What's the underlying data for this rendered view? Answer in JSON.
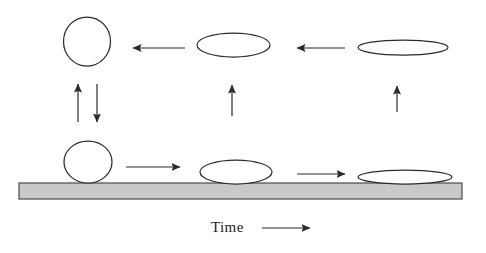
{
  "figure": {
    "axis_label": "Time",
    "axis_arrow_direction": "right",
    "background_color": "#ffffff",
    "outline_color": "#2b2b2b",
    "surface_fill_color": "#c9c9c9",
    "surface_stroke_color": "#4a4a4a"
  },
  "surface": {
    "name": "solid surface bar",
    "x": 19,
    "y": 183,
    "width": 443,
    "height": 16
  },
  "shapes": {
    "top_row": [
      {
        "name": "airborne-sphere",
        "type": "circle",
        "cx": 87,
        "cy": 41.5,
        "rx": 23.5,
        "ry": 24.5,
        "stage": "spherical"
      },
      {
        "name": "airborne-ellipse-mid",
        "type": "ellipse",
        "cx": 233.5,
        "cy": 45,
        "rx": 36.5,
        "ry": 12,
        "stage": "flattened"
      },
      {
        "name": "airborne-ellipse-flat",
        "type": "ellipse",
        "cx": 403,
        "cy": 47.5,
        "rx": 45,
        "ry": 7.5,
        "stage": "very flattened"
      }
    ],
    "bottom_row": [
      {
        "name": "resting-sphere",
        "type": "circle",
        "cx": 88,
        "cy": 162,
        "rx": 24,
        "ry": 21,
        "stage": "spherical"
      },
      {
        "name": "spreading-ellipse-mid",
        "type": "ellipse",
        "cx": 236,
        "cy": 172,
        "rx": 36,
        "ry": 12,
        "stage": "spreading"
      },
      {
        "name": "spreading-ellipse-flat",
        "type": "ellipse",
        "cx": 405,
        "cy": 177,
        "rx": 47,
        "ry": 7,
        "stage": "fully spread"
      }
    ]
  },
  "arrows": {
    "top_row": [
      {
        "name": "top-arrow-left-1",
        "direction": "left",
        "x_start": 185,
        "x_end": 133,
        "y": 48
      },
      {
        "name": "top-arrow-left-2",
        "direction": "left",
        "x_start": 345,
        "x_end": 297,
        "y": 48
      }
    ],
    "vertical": [
      {
        "name": "vertical-arrow-up-left",
        "direction": "up",
        "x": 78,
        "y_start": 122,
        "y_end": 84
      },
      {
        "name": "vertical-arrow-down-left",
        "direction": "down",
        "x": 97,
        "y_start": 84,
        "y_end": 122
      },
      {
        "name": "vertical-arrow-up-middle",
        "direction": "up",
        "x": 232,
        "y_start": 116,
        "y_end": 85
      },
      {
        "name": "vertical-arrow-up-right",
        "direction": "up",
        "x": 397,
        "y_start": 112,
        "y_end": 86
      }
    ],
    "bottom_row": [
      {
        "name": "bottom-arrow-right-1",
        "direction": "right",
        "x_start": 126,
        "x_end": 180,
        "y": 167
      },
      {
        "name": "bottom-arrow-right-2",
        "direction": "right",
        "x_start": 297,
        "x_end": 345,
        "y": 174
      }
    ],
    "axis": {
      "name": "time-axis-arrow",
      "direction": "right",
      "x_start": 262,
      "x_end": 310,
      "y": 228
    }
  },
  "labels": {
    "time": {
      "text": "Time",
      "x": 211,
      "y": 219
    }
  }
}
